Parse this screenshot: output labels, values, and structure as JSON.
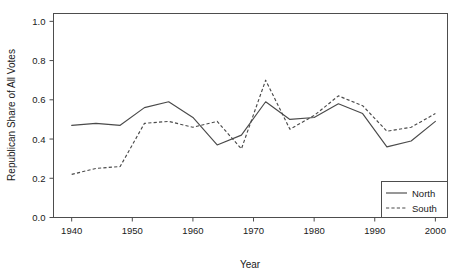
{
  "chart_data": {
    "type": "line",
    "title": "",
    "xlabel": "Year",
    "ylabel": "Republican Share of All Votes",
    "xlim": [
      1937,
      2002
    ],
    "ylim": [
      0.0,
      1.04
    ],
    "grid": false,
    "legend_position": "bottom-right",
    "x_ticks": [
      1940,
      1950,
      1960,
      1970,
      1980,
      1990,
      2000
    ],
    "x_tick_labels": [
      "1940",
      "1950",
      "1960",
      "1970",
      "1980",
      "1990",
      "2000"
    ],
    "y_ticks": [
      0.0,
      0.2,
      0.4,
      0.6,
      0.8,
      1.0
    ],
    "y_tick_labels": [
      "0.0",
      "0.2",
      "0.4",
      "0.6",
      "0.8",
      "1.0"
    ],
    "x": [
      1940,
      1944,
      1948,
      1952,
      1956,
      1960,
      1964,
      1968,
      1972,
      1976,
      1980,
      1984,
      1988,
      1992,
      1996,
      2000
    ],
    "series": [
      {
        "name": "North",
        "style": "solid",
        "color": "#4a4a4a",
        "values": [
          0.47,
          0.48,
          0.47,
          0.56,
          0.59,
          0.51,
          0.37,
          0.42,
          0.59,
          0.5,
          0.51,
          0.58,
          0.53,
          0.36,
          0.39,
          0.49
        ]
      },
      {
        "name": "South",
        "style": "dashed",
        "color": "#4a4a4a",
        "values": [
          0.22,
          0.25,
          0.26,
          0.48,
          0.49,
          0.46,
          0.49,
          0.35,
          0.7,
          0.45,
          0.52,
          0.62,
          0.57,
          0.44,
          0.46,
          0.53
        ]
      }
    ]
  },
  "legend": {
    "entries": [
      {
        "label": "North",
        "style": "solid"
      },
      {
        "label": "South",
        "style": "dashed"
      }
    ]
  },
  "axes": {
    "x_title": "Year",
    "y_title": "Republican Share of All Votes"
  }
}
